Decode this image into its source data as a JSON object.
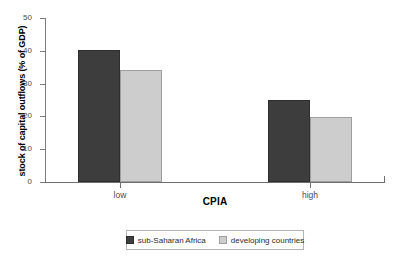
{
  "chart_data": {
    "type": "bar",
    "title": "",
    "xlabel": "CPIA",
    "ylabel": "stock of capital outflows (% of GDP)",
    "categories": [
      "low",
      "high"
    ],
    "series": [
      {
        "name": "sub-Saharan Africa",
        "values": [
          40.2,
          25.0
        ],
        "color": "#3d3d3d"
      },
      {
        "name": "developing countries",
        "values": [
          34.2,
          19.8
        ],
        "color": "#cdcdcd"
      }
    ],
    "ylim": [
      0,
      50
    ],
    "yticks": [
      0,
      10,
      20,
      30,
      40,
      50
    ],
    "ytick_labels": [
      "0",
      "10",
      "20",
      "30",
      "40",
      "50"
    ],
    "grid": false,
    "legend_position": "bottom"
  }
}
